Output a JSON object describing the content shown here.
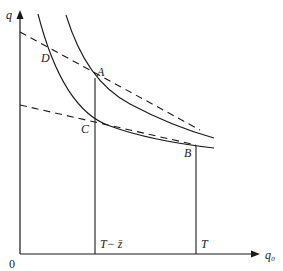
{
  "diagram": {
    "axes": {
      "y_label": "q",
      "x_label": "q₀",
      "origin_label": "0"
    },
    "points": {
      "A": "A",
      "B": "B",
      "C": "C",
      "D": "D"
    },
    "ticks": {
      "t_minus_z": "T− z̄",
      "t": "T"
    },
    "colors": {
      "line": "#1a1a1a",
      "background": "#ffffff"
    }
  }
}
